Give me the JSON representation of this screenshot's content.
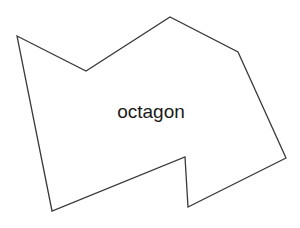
{
  "canvas": {
    "width": 300,
    "height": 228,
    "background_color": "#ffffff"
  },
  "shape": {
    "name": "octagon",
    "label": "octagon",
    "stroke_color": "#3a3a3a",
    "stroke_width": 1.3,
    "fill_color": "none",
    "vertex_count": 8,
    "vertices": [
      [
        17,
        36
      ],
      [
        86,
        71
      ],
      [
        170,
        17
      ],
      [
        238,
        52
      ],
      [
        286,
        158
      ],
      [
        188,
        207
      ],
      [
        185,
        157
      ],
      [
        52,
        211
      ]
    ],
    "points_attr": "17,36 86,71 170,17 238,52 286,158 188,207 185,157 52,211",
    "label_position": {
      "x": 151,
      "y": 111,
      "font_size": 19,
      "color": "#1a1a1a"
    }
  }
}
